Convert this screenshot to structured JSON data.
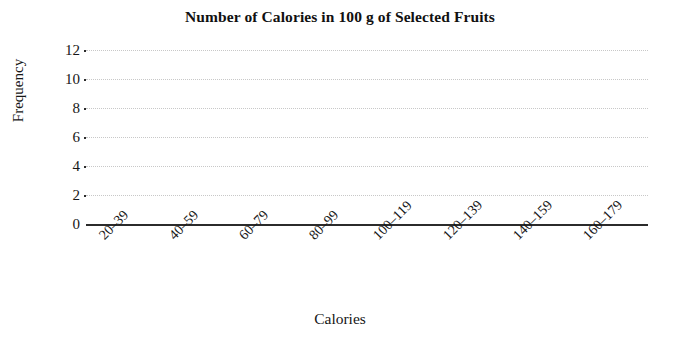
{
  "chart_data": {
    "type": "bar",
    "title": "Number of Calories in 100 g of Selected Fruits",
    "xlabel": "Calories",
    "ylabel": "Frequency",
    "categories": [
      "20–39",
      "40–59",
      "60–79",
      "80–99",
      "100–119",
      "120–139",
      "140–159",
      "160–179"
    ],
    "values": [
      0,
      0,
      0,
      0,
      0,
      0,
      0,
      0
    ],
    "ylim": [
      0,
      12
    ],
    "ytick_labels": [
      "0",
      "2",
      "4",
      "6",
      "8",
      "10",
      "12"
    ],
    "ytick_values": [
      0,
      2,
      4,
      6,
      8,
      10,
      12
    ],
    "grid": "horizontal-dotted",
    "legend": "none",
    "bar_color": "#4a4a4a",
    "grid_color": "#c8c8c8",
    "axis_color": "#2b2b2b",
    "note": "Blank template histogram: plot area contains no plotted bars."
  }
}
